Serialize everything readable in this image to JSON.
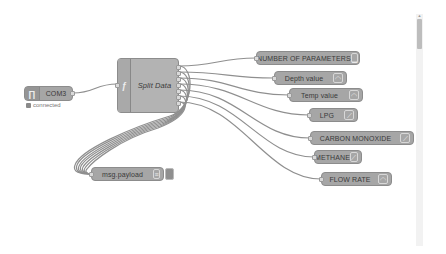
{
  "canvas": {
    "background": "#ffffff",
    "node_color": "#a6a6a6",
    "wire_color": "#8f8f8f"
  },
  "nodes": {
    "serial_in": {
      "label": "COM3",
      "icon": "serial-port-icon",
      "status": "connected"
    },
    "function": {
      "label": "Split Data",
      "icon": "function-icon",
      "outputs": 7
    },
    "debug": {
      "label": "msg.payload",
      "icon": "debug-list-icon"
    },
    "outputs": [
      {
        "label": "NUMBER OF PARAMETERS",
        "icon": "text-icon"
      },
      {
        "label": "Depth value",
        "icon": "gauge-icon"
      },
      {
        "label": "Temp value",
        "icon": "gauge-icon"
      },
      {
        "label": "LPG",
        "icon": "chart-icon"
      },
      {
        "label": "CARBON MONOXIDE",
        "icon": "chart-icon"
      },
      {
        "label": "METHANE",
        "icon": "chart-icon"
      },
      {
        "label": "FLOW RATE",
        "icon": "gauge-icon"
      }
    ]
  }
}
